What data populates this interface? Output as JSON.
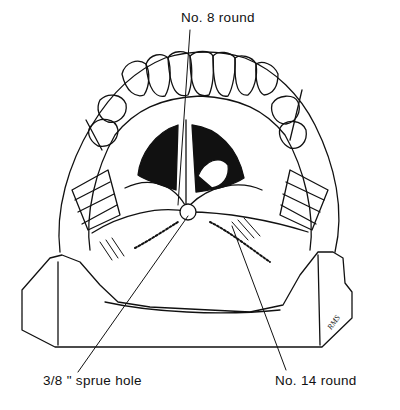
{
  "figure": {
    "line_color": "#111111",
    "background": "#ffffff"
  },
  "labels": {
    "top": "No. 8  round",
    "bottom_left": "3/8 \" sprue hole",
    "bottom_right": "No. 14 round"
  },
  "signature": "RMS"
}
